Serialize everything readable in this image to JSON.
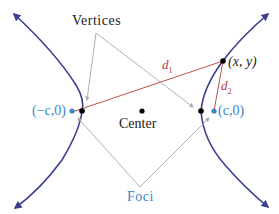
{
  "diagram": {
    "labels": {
      "vertices": "Vertices",
      "center": "Center",
      "foci": "Foci",
      "left_focus": "(−c,0)",
      "right_focus": "(c,0)",
      "point": "(x, y)",
      "d1": "d",
      "d1_sub": "1",
      "d2": "d",
      "d2_sub": "2"
    },
    "colors": {
      "curve": "#3a3f8f",
      "focus": "#3a86c8",
      "distance": "#c0504d",
      "pointer": "#a8a8a8",
      "text": "#222222"
    }
  }
}
